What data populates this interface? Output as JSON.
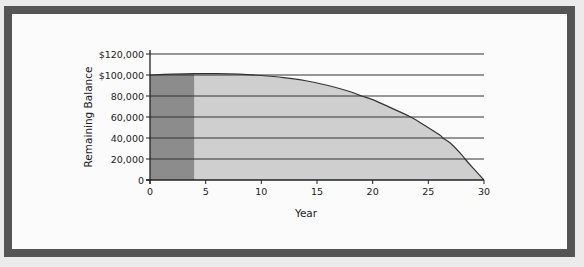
{
  "figure": {
    "title_partial": "",
    "frame_color": "#555555",
    "background_color": "#fbfbfb"
  },
  "chart_data": {
    "type": "area",
    "title": "",
    "xlabel": "Year",
    "ylabel": "Remaining Balance",
    "xlim": [
      0,
      30
    ],
    "ylim": [
      0,
      120000
    ],
    "x_ticks": [
      0,
      5,
      10,
      15,
      20,
      25,
      30
    ],
    "x_tick_labels": [
      "0",
      "5",
      "10",
      "15",
      "20",
      "25",
      "30"
    ],
    "y_ticks": [
      0,
      20000,
      40000,
      60000,
      80000,
      100000,
      120000
    ],
    "y_tick_labels": [
      "0",
      "20,000",
      "40,000",
      "60,000",
      "80,000",
      "$100,000",
      "$120,000"
    ],
    "grid": {
      "horizontal": true,
      "vertical": false
    },
    "legend": null,
    "shaded_regions": [
      {
        "name": "Initial period",
        "x_start": 0,
        "x_end": 4,
        "color": "#8c8c8c"
      },
      {
        "name": "Remaining term",
        "x_start": 4,
        "x_end": 30,
        "color": "#cfcfcf"
      }
    ],
    "series": [
      {
        "name": "Remaining Balance",
        "x": [
          0,
          2,
          4,
          6,
          8,
          10,
          12,
          14,
          16,
          18,
          19,
          20,
          22,
          23.4,
          24,
          26,
          26.3,
          27,
          28,
          28.3,
          29,
          30
        ],
        "values": [
          100000,
          100800,
          101300,
          101300,
          100800,
          99500,
          97500,
          94500,
          90000,
          84000,
          80000,
          76500,
          67000,
          60000,
          56500,
          43000,
          40000,
          35000,
          24000,
          20000,
          11500,
          0
        ]
      }
    ]
  }
}
